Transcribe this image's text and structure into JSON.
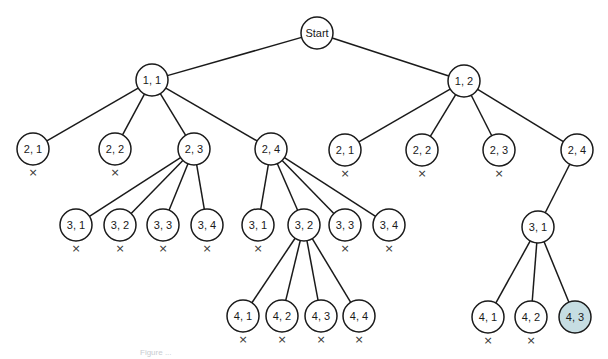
{
  "diagram": {
    "type": "search-tree",
    "root": "start",
    "colors": {
      "edge": "#1a1a1a",
      "node_fill": "#ffffff",
      "node_stroke": "#1a1a1a",
      "goal_fill": "#c6dde2",
      "prune_mark": "#333333"
    },
    "prune_symbol": "×",
    "nodes": [
      {
        "id": "start",
        "label": "Start",
        "x": 317,
        "y": 33,
        "pruned": false
      },
      {
        "id": "n11",
        "label": "1, 1",
        "x": 152,
        "y": 80,
        "parent": "start",
        "pruned": false
      },
      {
        "id": "n12",
        "label": "1, 2",
        "x": 464,
        "y": 81,
        "parent": "start",
        "pruned": false
      },
      {
        "id": "n11_21",
        "label": "2, 1",
        "x": 33,
        "y": 149,
        "parent": "n11",
        "pruned": true
      },
      {
        "id": "n11_22",
        "label": "2, 2",
        "x": 115,
        "y": 149,
        "parent": "n11",
        "pruned": true
      },
      {
        "id": "n11_23",
        "label": "2, 3",
        "x": 194,
        "y": 149,
        "parent": "n11",
        "pruned": false
      },
      {
        "id": "n11_24",
        "label": "2, 4",
        "x": 271,
        "y": 149,
        "parent": "n11",
        "pruned": false
      },
      {
        "id": "n12_21",
        "label": "2, 1",
        "x": 345,
        "y": 150,
        "parent": "n12",
        "pruned": true
      },
      {
        "id": "n12_22",
        "label": "2, 2",
        "x": 422,
        "y": 150,
        "parent": "n12",
        "pruned": true
      },
      {
        "id": "n12_23",
        "label": "2, 3",
        "x": 499,
        "y": 150,
        "parent": "n12",
        "pruned": true
      },
      {
        "id": "n12_24",
        "label": "2, 4",
        "x": 577,
        "y": 150,
        "parent": "n12",
        "pruned": false
      },
      {
        "id": "n23_31",
        "label": "3, 1",
        "x": 76,
        "y": 225,
        "parent": "n11_23",
        "pruned": true
      },
      {
        "id": "n23_32",
        "label": "3, 2",
        "x": 120,
        "y": 225,
        "parent": "n11_23",
        "pruned": true
      },
      {
        "id": "n23_33",
        "label": "3, 3",
        "x": 163,
        "y": 225,
        "parent": "n11_23",
        "pruned": true
      },
      {
        "id": "n23_34",
        "label": "3, 4",
        "x": 207,
        "y": 225,
        "parent": "n11_23",
        "pruned": true
      },
      {
        "id": "n24_31",
        "label": "3, 1",
        "x": 258,
        "y": 225,
        "parent": "n11_24",
        "pruned": true
      },
      {
        "id": "n24_32",
        "label": "3, 2",
        "x": 304,
        "y": 225,
        "parent": "n11_24",
        "pruned": false
      },
      {
        "id": "n24_33",
        "label": "3, 3",
        "x": 345,
        "y": 225,
        "parent": "n11_24",
        "pruned": true
      },
      {
        "id": "n24_34",
        "label": "3, 4",
        "x": 389,
        "y": 225,
        "parent": "n11_24",
        "pruned": true
      },
      {
        "id": "n124_31",
        "label": "3, 1",
        "x": 538,
        "y": 227,
        "parent": "n12_24",
        "pruned": false
      },
      {
        "id": "n32_41",
        "label": "4, 1",
        "x": 243,
        "y": 316,
        "parent": "n24_32",
        "pruned": true
      },
      {
        "id": "n32_42",
        "label": "4, 2",
        "x": 282,
        "y": 316,
        "parent": "n24_32",
        "pruned": true
      },
      {
        "id": "n32_43",
        "label": "4, 3",
        "x": 321,
        "y": 316,
        "parent": "n24_32",
        "pruned": true
      },
      {
        "id": "n32_44",
        "label": "4, 4",
        "x": 359,
        "y": 316,
        "parent": "n24_32",
        "pruned": true
      },
      {
        "id": "n31_41",
        "label": "4, 1",
        "x": 488,
        "y": 317,
        "parent": "n124_31",
        "pruned": true
      },
      {
        "id": "n31_42",
        "label": "4, 2",
        "x": 531,
        "y": 317,
        "parent": "n124_31",
        "pruned": true
      },
      {
        "id": "n31_43",
        "label": "4, 3",
        "x": 575,
        "y": 317,
        "parent": "n124_31",
        "pruned": false,
        "goal": true
      }
    ]
  },
  "caption": "Figure ..."
}
